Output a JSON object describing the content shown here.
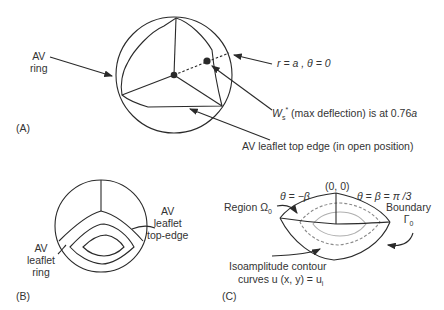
{
  "panel_a": {
    "tag": "(A)",
    "labels": {
      "av_ring_line1": "AV",
      "av_ring_line2": "ring",
      "r_theta": "r = a ,  θ = 0",
      "ws_symbol": "W",
      "ws_sub": "s",
      "ws_sup": "*",
      "ws_text": " (max deflection) is at 0.76",
      "ws_a": "a",
      "leaflet_edge": "AV leaflet top edge (in open position)"
    }
  },
  "panel_b": {
    "tag": "(B)",
    "labels": {
      "ring_line1": "AV",
      "ring_line2": "leaflet",
      "ring_line3": "ring",
      "edge_line1": "AV",
      "edge_line2": "leaflet",
      "edge_line3": "top-edge"
    }
  },
  "panel_c": {
    "tag": "(C)",
    "labels": {
      "origin": "(0, 0)",
      "theta_neg": "θ = −β",
      "theta_pos": "θ = β = π /3",
      "region": "Region Ω",
      "region_sub": "0",
      "boundary_line1": "Boundary",
      "boundary_sym": "Γ",
      "boundary_sub": "0",
      "iso_line1": "Isoamplitude contour",
      "iso_line2": "curves u (x, y) = u",
      "iso_sub": "i"
    }
  },
  "colors": {
    "stroke": "#2a2a2a",
    "dashed": "#8a8a8a",
    "light_contour": "#b0b0b0"
  }
}
